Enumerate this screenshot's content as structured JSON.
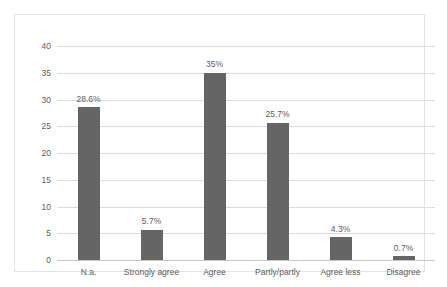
{
  "chart_data": {
    "type": "bar",
    "title": "",
    "subtitle": "",
    "xlabel": "",
    "ylabel": "",
    "categories": [
      "N.a.",
      "Strongly agree",
      "Agree",
      "Partly/partly",
      "Agree less",
      "Disagree"
    ],
    "values": [
      28.6,
      5.7,
      35,
      25.7,
      4.3,
      0.7
    ],
    "data_labels": [
      "28.6%",
      "5.7%",
      "35%",
      "25.7%",
      "4.3%",
      "0.7%"
    ],
    "ylim": [
      0,
      40
    ],
    "ytick_labels": [
      "0",
      "5",
      "10",
      "15",
      "20",
      "25",
      "30",
      "35",
      "40"
    ],
    "ytick_values": [
      0,
      5,
      10,
      15,
      20,
      25,
      30,
      35,
      40
    ],
    "grid": true,
    "grid_axis": "y",
    "legend": false,
    "legend_position": "none",
    "colors": {
      "bar": "#656565",
      "gridline": "#dcdcdc",
      "axis_line": "#c8c8c8",
      "text": "#5d5d5d",
      "plot_background": "#ffffff",
      "chart_border": "#e2e2e2"
    }
  }
}
